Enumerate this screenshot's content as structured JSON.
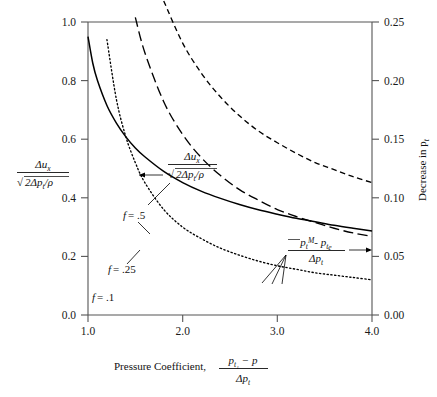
{
  "figure": {
    "background": "#ffffff",
    "ink": "#000000"
  },
  "chart_data": {
    "type": "line",
    "title": "",
    "xlabel": "Pressure Coefficient, (p_t1 - p)/Δp_t",
    "ylabel": "Δu_x/√(2Δp_t/ρ)",
    "y2label": "Decrease in p_t",
    "xlim": [
      1.0,
      4.0
    ],
    "ylim": [
      0.0,
      1.0
    ],
    "y2lim": [
      0.0,
      0.25
    ],
    "grid": false,
    "legend": "inline-annotations",
    "xticks": [
      "1.0",
      "2.0",
      "3.0",
      "4.0"
    ],
    "xtick_values": [
      1.0,
      2.0,
      3.0,
      4.0
    ],
    "yticks": [
      "0.0",
      "0.2",
      "0.4",
      "0.6",
      "0.8",
      "1.0"
    ],
    "ytick_values": [
      0.0,
      0.2,
      0.4,
      0.6,
      0.8,
      1.0
    ],
    "y2ticks": [
      "0.00",
      "0.05",
      "0.10",
      "0.15",
      "0.20",
      "0.25"
    ],
    "y2tick_values": [
      0.0,
      0.05,
      0.1,
      0.15,
      0.2,
      0.25
    ],
    "x": [
      1.0,
      1.05,
      1.1,
      1.2,
      1.3,
      1.4,
      1.5,
      1.6,
      1.8,
      2.0,
      2.2,
      2.4,
      2.6,
      2.8,
      3.0,
      3.2,
      3.4,
      3.6,
      3.8,
      4.0
    ],
    "series": [
      {
        "name": "velocity-ratio",
        "label": "Δu_x/√(2Δp_t/ρ)",
        "style": "solid",
        "axis": "left",
        "values": [
          0.95,
          0.86,
          0.8,
          0.715,
          0.655,
          0.608,
          0.57,
          0.54,
          0.49,
          0.452,
          0.422,
          0.398,
          0.377,
          0.359,
          0.344,
          0.33,
          0.318,
          0.306,
          0.296,
          0.287
        ]
      },
      {
        "name": "f-0.5",
        "label": "f = .5",
        "style": "dashed",
        "axis": "right",
        "values": [
          0.96,
          0.81,
          0.7,
          0.56,
          0.47,
          0.405,
          0.358,
          0.322,
          0.268,
          0.232,
          0.206,
          0.186,
          0.17,
          0.157,
          0.147,
          0.138,
          0.13,
          0.124,
          0.118,
          0.113
        ]
      },
      {
        "name": "f-0.25",
        "label": "f = .25",
        "style": "long-dash",
        "axis": "right",
        "values": [
          0.92,
          0.7,
          0.572,
          0.43,
          0.348,
          0.294,
          0.254,
          0.224,
          0.182,
          0.154,
          0.134,
          0.119,
          0.107,
          0.098,
          0.09,
          0.084,
          0.079,
          0.074,
          0.07,
          0.067
        ]
      },
      {
        "name": "f-0.1",
        "label": "f = .1",
        "style": "dotted",
        "axis": "right",
        "values": [
          0.6,
          0.42,
          0.33,
          0.235,
          0.184,
          0.152,
          0.13,
          0.113,
          0.09,
          0.075,
          0.065,
          0.057,
          0.051,
          0.046,
          0.042,
          0.039,
          0.036,
          0.034,
          0.032,
          0.03
        ]
      }
    ],
    "annotations": [
      {
        "name": "velocity-ratio-callout",
        "text": "Δu_x/√(2Δp_t/ρ)",
        "arrow": "left"
      },
      {
        "name": "total-pressure-callout",
        "text": "(p̄_t^M - p_t_e)/Δp_t",
        "arrow": "right"
      },
      {
        "name": "curve-label-f05",
        "text": "f = .5"
      },
      {
        "name": "curve-label-f025",
        "text": "f = .25"
      },
      {
        "name": "curve-label-f01",
        "text": "f = .1"
      }
    ]
  },
  "axes": {
    "x": {
      "label_prefix": "Pressure Coefficient,",
      "numerator_p": "p",
      "numerator_sub": "t₁",
      "numerator_minus": "− p",
      "denominator": "Δp",
      "denominator_sub": "t"
    },
    "left": {
      "numerator": "Δu",
      "numerator_sub": "x",
      "denominator_radical": "√",
      "denominator": "2Δp",
      "denominator_sub": "t",
      "denominator_tail": "/ρ"
    },
    "right": {
      "label_text": "Decrease in p",
      "label_sub": "t"
    }
  },
  "callouts": {
    "velocity": {
      "numerator": "Δu",
      "numerator_sub": "x",
      "denominator": "2Δp",
      "denominator_sub": "t",
      "denominator_tail": "/ρ"
    },
    "pressure": {
      "num_p": "p",
      "num_sub": "t",
      "num_sup": "M",
      "num_minus": "- p",
      "num_sub2": "t",
      "num_sub3": "e",
      "den": "Δp",
      "den_sub": "t"
    },
    "f_labels": {
      "f05": "f",
      "f05_val": "= .5",
      "f025": "f",
      "f025_val": "= .25",
      "f01": "f",
      "f01_val": "= .1"
    }
  }
}
